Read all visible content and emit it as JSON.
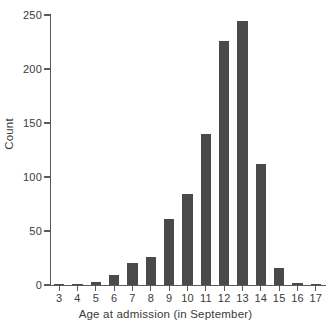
{
  "chart_data": {
    "type": "bar",
    "title": "",
    "xlabel": "Age at admission (in September)",
    "ylabel": "Count",
    "categories": [
      "3",
      "4",
      "5",
      "6",
      "7",
      "8",
      "9",
      "10",
      "11",
      "12",
      "13",
      "14",
      "15",
      "16",
      "17"
    ],
    "values": [
      1,
      1,
      3,
      9,
      20,
      26,
      61,
      84,
      140,
      226,
      244,
      112,
      16,
      2,
      1
    ],
    "ylim": [
      0,
      250
    ],
    "yticks": [
      0,
      50,
      100,
      150,
      200,
      250
    ],
    "ytick_labels": [
      "0",
      "50",
      "100",
      "150",
      "200",
      "250"
    ],
    "xtick_labels": [
      "3",
      "4",
      "5",
      "6",
      "7",
      "8",
      "9",
      "10",
      "11",
      "12",
      "13",
      "14",
      "15",
      "16",
      "17"
    ],
    "grid": false,
    "legend": null,
    "series": [
      {
        "name": "Count",
        "values": [
          1,
          1,
          3,
          9,
          20,
          26,
          61,
          84,
          140,
          226,
          244,
          112,
          16,
          2,
          1
        ]
      }
    ],
    "bar_color": "#4a4a4a",
    "axis_color": "#5b5b5b",
    "background_color": "#ffffff"
  }
}
